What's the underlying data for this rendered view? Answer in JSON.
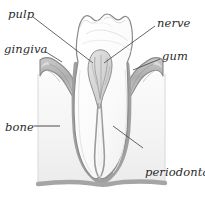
{
  "figure": {
    "width": 205,
    "height": 198,
    "background_color": "#ffffff"
  },
  "palette": {
    "outline": "#8a8a8a",
    "outline_dark": "#6f6f6f",
    "leader_line": "#4a4a4a",
    "enamel_fill": "#fcfcfc",
    "dentin_fill": "#f6f6f6",
    "bone_fill": "#f4f4f4",
    "gum_fill": "#b3b3b3",
    "gum_shade": "#cfcfcf",
    "pulp_fill": "#d9d9d9",
    "root_canal": "#9a9a9a",
    "base_band": "#a5a5a5",
    "label_text": "#2b2b2b"
  },
  "labels": [
    {
      "id": "pulp",
      "text": "pulp",
      "position": "top-left",
      "x": 8,
      "y": 8,
      "points_to": "pulp-chamber"
    },
    {
      "id": "nerve",
      "text": "nerve",
      "position": "top-right",
      "x": 157,
      "y": 17,
      "points_to": "root-canal-nerve"
    },
    {
      "id": "gingiva",
      "text": "gingiva",
      "position": "middle-left",
      "x": 4,
      "y": 43,
      "points_to": "left-gum"
    },
    {
      "id": "gum",
      "text": "gum",
      "position": "middle-right",
      "x": 162,
      "y": 50,
      "points_to": "right-gum"
    },
    {
      "id": "bone",
      "text": "bone",
      "position": "lower-left",
      "x": 5,
      "y": 121,
      "points_to": "bone-block"
    },
    {
      "id": "periodontal-membrane",
      "text": "periodontal\nmembrane",
      "line1": "periodontal",
      "line2": "membrane",
      "position": "lower-right",
      "x": 145,
      "y": 141,
      "points_to": "root-surface-membrane"
    }
  ],
  "anatomy_parts": [
    {
      "id": "crown",
      "name": "tooth crown with cusps"
    },
    {
      "id": "pulp-chamber",
      "name": "pulp chamber"
    },
    {
      "id": "root-canal-nerve",
      "name": "root canal / nerve"
    },
    {
      "id": "left-root",
      "name": "left root"
    },
    {
      "id": "right-root",
      "name": "right root"
    },
    {
      "id": "left-gum",
      "name": "left gingiva"
    },
    {
      "id": "right-gum",
      "name": "right gum"
    },
    {
      "id": "bone-block",
      "name": "alveolar bone"
    },
    {
      "id": "periodontal-line",
      "name": "periodontal membrane"
    },
    {
      "id": "base-band",
      "name": "basal bone band"
    }
  ]
}
